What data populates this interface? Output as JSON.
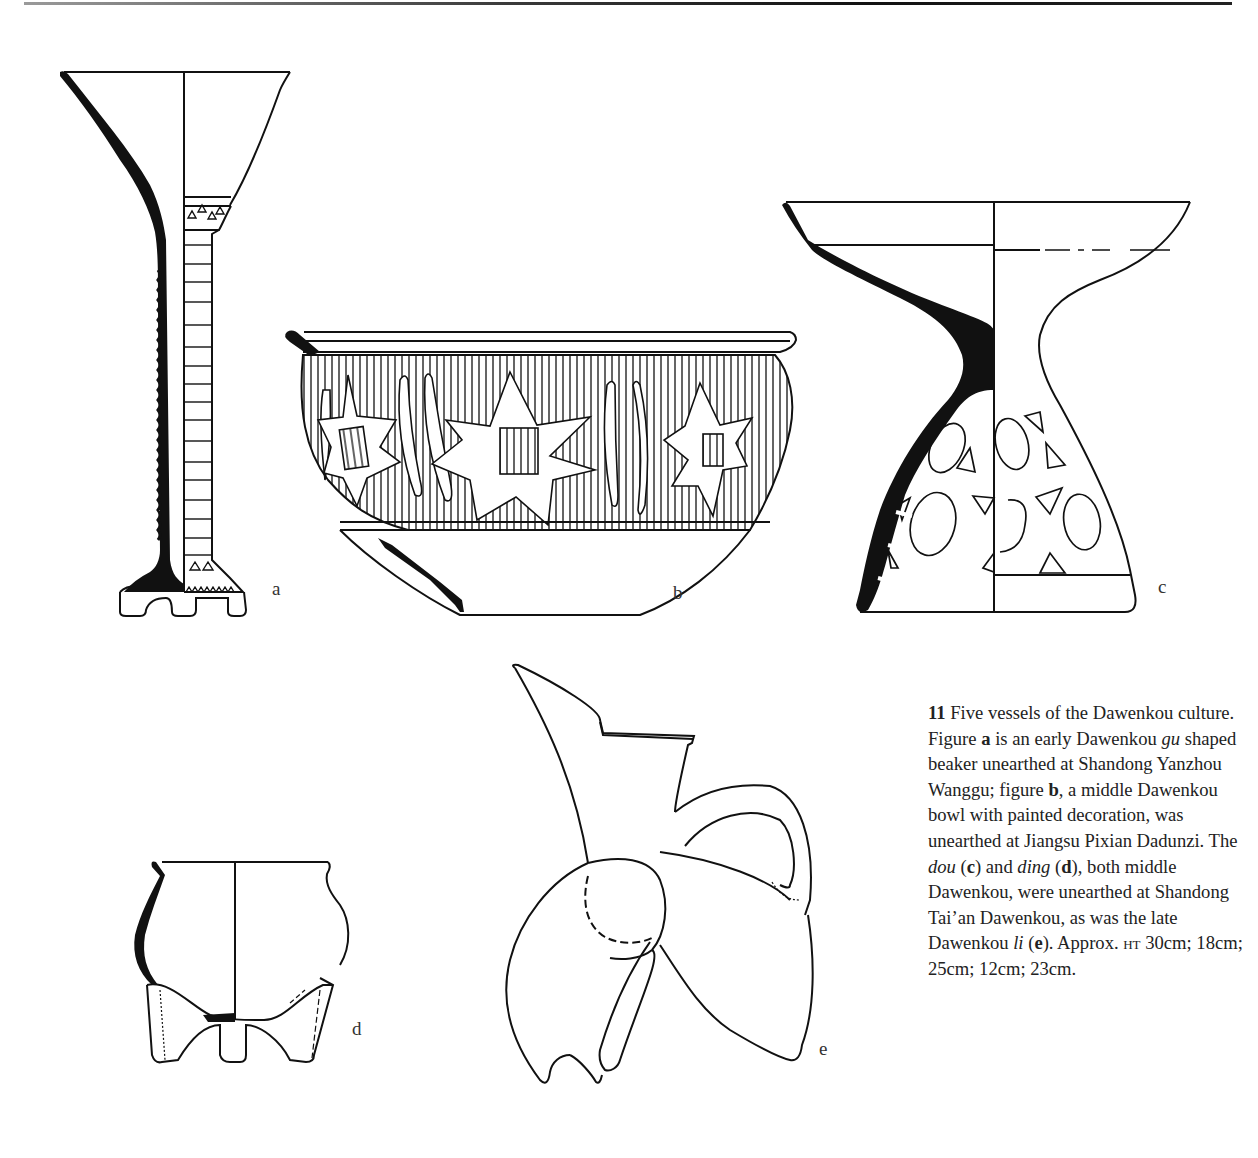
{
  "figure": {
    "number": "11",
    "labels": [
      "a",
      "b",
      "c",
      "d",
      "e"
    ],
    "caption": {
      "fig_number": "11",
      "lead": " Five vessels of the Dawenkou culture. Figure ",
      "a_label": "a",
      "a_text_1": " is an early Dawenkou ",
      "a_term": "gu",
      "a_text_2": " shaped beaker unearthed at Shandong Yanzhou Wanggu; figure ",
      "b_label": "b",
      "b_text": ", a middle Dawenkou bowl with painted decoration, was unearthed at Jiangsu Pixian Dadunzi. The ",
      "c_term": "dou",
      "c_open": " (",
      "c_label": "c",
      "c_close": ") and ",
      "d_term": "ding",
      "d_open": " (",
      "d_label": "d",
      "d_text": "), both middle Dawenkou, were unearthed at Shandong Tai’an Dawenkou, as was the late Dawenkou ",
      "e_term": "li",
      "e_open": " (",
      "e_label": "e",
      "e_close": "). Approx. ",
      "ht_abbr": "ht",
      "heights": " 30cm; 18cm; 25cm; 12cm; 23cm."
    }
  }
}
